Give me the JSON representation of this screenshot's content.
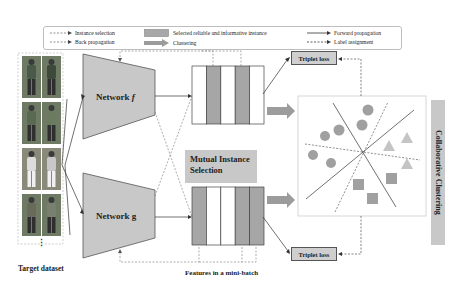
{
  "legend": {
    "instance_selection": "Instance selection",
    "back_propagation": "Back propagation",
    "selected_instance": "Selected reliable and informative instance",
    "clustering": "Clustering",
    "forward_propagation": "Forward propagation",
    "label_assignment": "Label assignment"
  },
  "networks": {
    "f_label": "Network f",
    "g_label": "Network g"
  },
  "mutual_instance_selection": [
    "Mutual Instance",
    "Selection"
  ],
  "triplet_loss_top": "Triplet loss",
  "triplet_loss_bottom": "Triplet loss",
  "collaborative_clustering": "Collaborative Clustering",
  "captions": {
    "target_dataset": "Target dataset",
    "features": "Features in a mini-batch",
    "ellipsis": "⋮"
  },
  "feature_batches": {
    "top_selected": [
      false,
      true,
      false,
      true,
      false
    ],
    "bottom_selected": [
      true,
      false,
      false,
      true,
      true
    ]
  },
  "colors": {
    "network_fill": "#c8c8c8",
    "selected_fill": "#a6a6a6",
    "cluster_shape": "#a0a0a0",
    "triangle": "#c4c4c4"
  }
}
